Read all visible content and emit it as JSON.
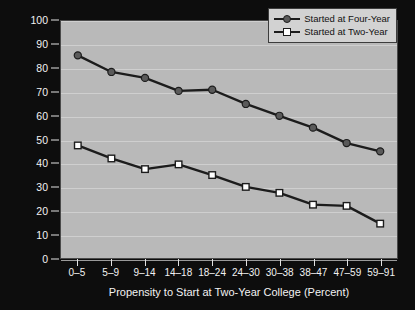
{
  "chart_data": {
    "type": "line",
    "title": "",
    "xlabel": "Propensity to Start at Two-Year College (Percent)",
    "ylabel": "Bachelor's Degree Attainment Rate (Percent)",
    "categories": [
      "0–5",
      "5–9",
      "9–14",
      "14–18",
      "18–24",
      "24–30",
      "30–38",
      "38–47",
      "47–59",
      "59–91"
    ],
    "ylim": [
      0,
      100
    ],
    "yticks": [
      0,
      10,
      20,
      30,
      40,
      50,
      60,
      70,
      80,
      90,
      100
    ],
    "ytick_labels": [
      "0",
      "10",
      "20",
      "30",
      "40",
      "50",
      "60",
      "70",
      "80",
      "90",
      "100"
    ],
    "grid": true,
    "legend_position": "top-right",
    "series": [
      {
        "name": "Started at Four-Year",
        "marker": "filled-circle",
        "color": "#5a5a5a",
        "line_color": "#1c1c1c",
        "values": [
          85.5,
          78.5,
          76.0,
          70.5,
          71.0,
          65.0,
          60.0,
          55.0,
          48.5,
          45.0
        ]
      },
      {
        "name": "Started at Two-Year",
        "marker": "open-square",
        "color": "#ffffff",
        "line_color": "#1c1c1c",
        "values": [
          47.5,
          42.0,
          37.5,
          39.5,
          35.0,
          30.0,
          27.5,
          22.5,
          22.0,
          14.5
        ]
      }
    ]
  },
  "legend": {
    "items": [
      {
        "label": "Started at Four-Year"
      },
      {
        "label": "Started at Two-Year"
      }
    ]
  },
  "colors": {
    "plot_background": "#b9b9b9",
    "figure_background": "#0d0d0d",
    "gridline": "#cfcfcf",
    "text": "#f2f2f2",
    "series_four_year": "#5a5a5a",
    "series_two_year": "#ffffff",
    "line": "#1c1c1c"
  }
}
